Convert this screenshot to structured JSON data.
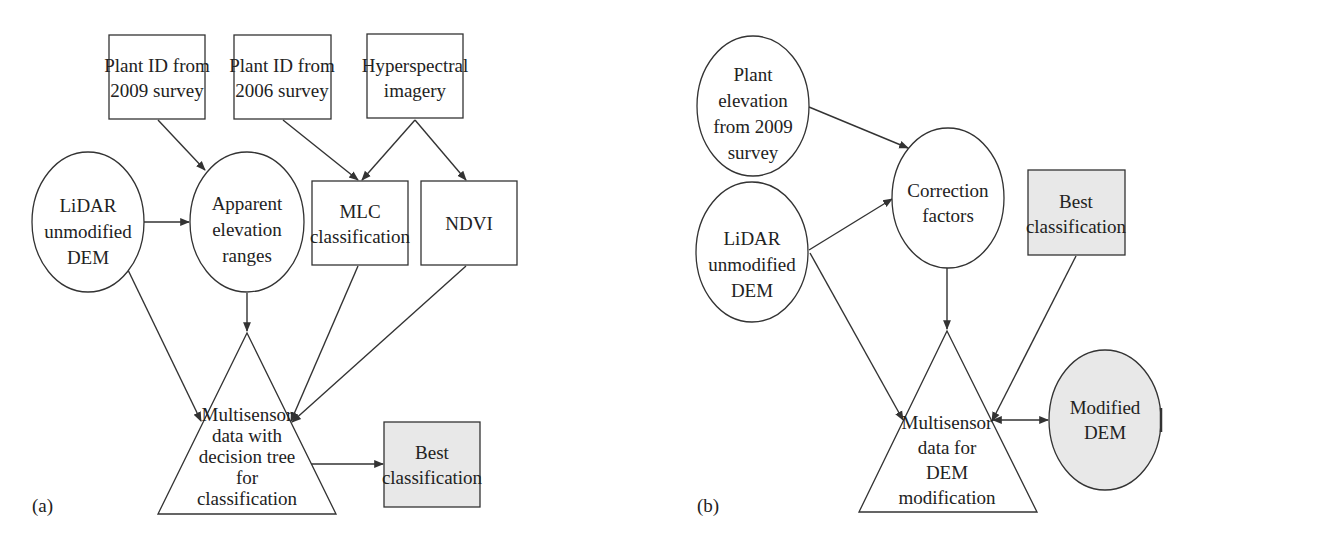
{
  "panel_a": {
    "label": "(a)",
    "nodes": {
      "plant_id_2009": [
        "Plant ID from",
        "2009 survey"
      ],
      "plant_id_2006": [
        "Plant ID from",
        "2006 survey"
      ],
      "hyperspectral": [
        "Hyperspectral",
        "imagery"
      ],
      "lidar": [
        "LiDAR",
        "unmodified",
        "DEM"
      ],
      "apparent": [
        "Apparent",
        "elevation",
        "ranges"
      ],
      "mlc": [
        "MLC",
        "classification"
      ],
      "ndvi": [
        "NDVI"
      ],
      "multisensor": [
        "Multisensor",
        "data with",
        "decision tree",
        "for",
        "classification"
      ],
      "best": [
        "Best",
        "classification"
      ]
    }
  },
  "panel_b": {
    "label": "(b)",
    "nodes": {
      "plant_elevation": [
        "Plant",
        "elevation",
        "from 2009",
        "survey"
      ],
      "lidar": [
        "LiDAR",
        "unmodified",
        "DEM"
      ],
      "correction": [
        "Correction",
        "factors"
      ],
      "best": [
        "Best",
        "classification"
      ],
      "multisensor": [
        "Multisensor",
        "data for",
        "DEM",
        "modification"
      ],
      "modified_dem": [
        "Modified",
        "DEM"
      ]
    }
  },
  "colors": {
    "stroke": "#333333",
    "shade": "#e8e8e8",
    "text": "#222222"
  }
}
